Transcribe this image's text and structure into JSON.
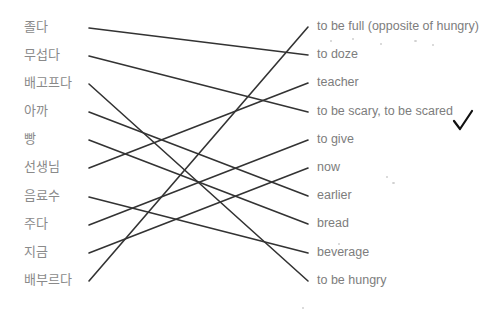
{
  "exercise": {
    "type": "matching",
    "left_items": [
      {
        "label": "졸다",
        "y": 28
      },
      {
        "label": "무섭다",
        "y": 56
      },
      {
        "label": "배고프다",
        "y": 84
      },
      {
        "label": "아까",
        "y": 112
      },
      {
        "label": "빵",
        "y": 140
      },
      {
        "label": "선생님",
        "y": 168
      },
      {
        "label": "음료수",
        "y": 197
      },
      {
        "label": "주다",
        "y": 225
      },
      {
        "label": "지금",
        "y": 253
      },
      {
        "label": "배부르다",
        "y": 281
      }
    ],
    "right_items": [
      {
        "label": "to be full (opposite of hungry)",
        "y": 27
      },
      {
        "label": "to doze",
        "y": 55
      },
      {
        "label": "teacher",
        "y": 83
      },
      {
        "label": "to be scary, to be scared",
        "y": 112
      },
      {
        "label": "to give",
        "y": 140
      },
      {
        "label": "now",
        "y": 168
      },
      {
        "label": "earlier",
        "y": 196
      },
      {
        "label": "bread",
        "y": 224
      },
      {
        "label": "beverage",
        "y": 253
      },
      {
        "label": "to be hungry",
        "y": 281
      }
    ],
    "matches": [
      {
        "left": 0,
        "right": 1
      },
      {
        "left": 1,
        "right": 3
      },
      {
        "left": 2,
        "right": 9
      },
      {
        "left": 3,
        "right": 6
      },
      {
        "left": 4,
        "right": 7
      },
      {
        "left": 5,
        "right": 2
      },
      {
        "left": 6,
        "right": 8
      },
      {
        "left": 7,
        "right": 4
      },
      {
        "left": 8,
        "right": 5
      },
      {
        "left": 9,
        "right": 0
      }
    ],
    "line_color": "#333333",
    "left_x": 89,
    "right_x": 308,
    "checkmark": "✓"
  }
}
